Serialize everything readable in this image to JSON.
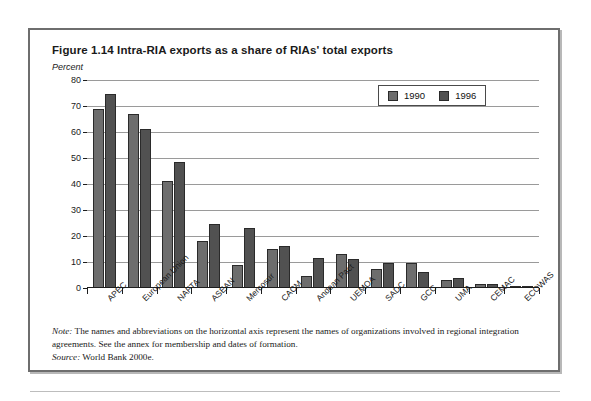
{
  "figure": {
    "title": "Figure 1.14  Intra-RIA exports as a share of RIAs' total exports",
    "unit_label": "Percent",
    "note_lead": "Note:",
    "note_text": " The names and abbreviations on the horizontal axis represent the names of organizations involved in regional integration agreements. See the annex for membership and dates of formation.",
    "source_lead": "Source:",
    "source_text": " World Bank 2000e."
  },
  "colors": {
    "series_1990": "#6d6d6d",
    "series_1996": "#515151",
    "axis": "#1d1d1d",
    "gridline": "#9a9a9a",
    "box_border": "#6e6e6e"
  },
  "chart_data": {
    "type": "bar",
    "title": "Figure 1.14  Intra-RIA exports as a share of RIAs' total exports",
    "xlabel": "",
    "ylabel": "Percent",
    "ylim": [
      0,
      80
    ],
    "yticks": [
      0,
      10,
      20,
      30,
      40,
      50,
      60,
      70,
      80
    ],
    "ytick_labels": [
      "0",
      "10",
      "20",
      "30",
      "40",
      "50",
      "60",
      "70",
      "80"
    ],
    "grid": true,
    "legend_position": "top-right",
    "categories": [
      "APEC",
      "European Union",
      "NAFTA",
      "ASEAN",
      "Mercosur",
      "CACM",
      "Andean Pact",
      "UEMOA",
      "SADC",
      "GCC",
      "UMA",
      "CEMAC",
      "ECOWAS"
    ],
    "series": [
      {
        "name": "1990",
        "color": "#6d6d6d",
        "values": [
          69,
          67,
          41,
          18,
          9,
          15,
          4.5,
          13,
          7.5,
          9.5,
          3,
          1.5,
          0.2
        ]
      },
      {
        "name": "1996",
        "color": "#515151",
        "values": [
          74.5,
          61,
          48.5,
          24.5,
          23,
          16,
          11.5,
          11,
          9.5,
          6,
          4,
          1.5,
          0.3
        ]
      }
    ]
  }
}
